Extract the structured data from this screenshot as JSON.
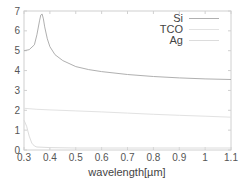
{
  "chart_data": {
    "type": "line",
    "title": "",
    "xlabel": "wavelength[µm]",
    "ylabel": "",
    "xlim": [
      0.3,
      1.1
    ],
    "ylim": [
      0,
      7
    ],
    "xticks": [
      "0.3",
      "0.4",
      "0.5",
      "0.6",
      "0.7",
      "0.8",
      "0.9",
      "1",
      "1.1"
    ],
    "yticks": [
      "0",
      "1",
      "2",
      "3",
      "4",
      "5",
      "6",
      "7"
    ],
    "grid": false,
    "legend_position": "upper right",
    "series": [
      {
        "name": "Si",
        "color": "#b0b0b0",
        "x": [
          0.3,
          0.32,
          0.34,
          0.35,
          0.36,
          0.365,
          0.37,
          0.375,
          0.38,
          0.39,
          0.4,
          0.42,
          0.45,
          0.5,
          0.55,
          0.6,
          0.7,
          0.8,
          0.9,
          1.0,
          1.1
        ],
        "y": [
          5.0,
          5.05,
          5.3,
          5.8,
          6.5,
          6.8,
          6.85,
          6.6,
          6.2,
          5.6,
          5.2,
          4.8,
          4.5,
          4.2,
          4.05,
          3.95,
          3.8,
          3.7,
          3.63,
          3.58,
          3.55
        ]
      },
      {
        "name": "TCO",
        "color": "#e2e2e2",
        "x": [
          0.3,
          0.35,
          0.4,
          0.5,
          0.6,
          0.7,
          0.8,
          0.9,
          1.0,
          1.1
        ],
        "y": [
          2.1,
          2.05,
          2.02,
          1.97,
          1.92,
          1.86,
          1.8,
          1.75,
          1.7,
          1.65
        ]
      },
      {
        "name": "Ag",
        "color": "#dcdcdc",
        "x": [
          0.3,
          0.31,
          0.32,
          0.33,
          0.34,
          0.35,
          0.4,
          0.5,
          0.6,
          0.7,
          0.8,
          0.9,
          1.0,
          1.1
        ],
        "y": [
          1.5,
          1.2,
          0.7,
          0.35,
          0.2,
          0.15,
          0.12,
          0.1,
          0.1,
          0.1,
          0.1,
          0.1,
          0.1,
          0.1
        ]
      }
    ]
  },
  "legend": {
    "items": [
      {
        "label": "Si"
      },
      {
        "label": "TCO"
      },
      {
        "label": "Ag"
      }
    ]
  }
}
